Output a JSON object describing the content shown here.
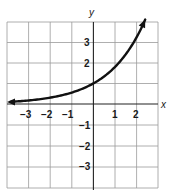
{
  "chart_data": {
    "type": "line",
    "title": "",
    "xlabel": "x",
    "ylabel": "y",
    "xlim": [
      -4,
      3
    ],
    "ylim": [
      -4,
      4
    ],
    "grid": true,
    "x_ticks": [
      "-3",
      "-2",
      "-1",
      "1",
      "2"
    ],
    "y_ticks": [
      "3",
      "2",
      "-1",
      "-2",
      "-3"
    ],
    "series": [
      {
        "name": "exponential curve (approx. y = 1.8^x)",
        "x": [
          -4,
          -3,
          -2,
          -1,
          0,
          1,
          2,
          2.4
        ],
        "y": [
          0.1,
          0.17,
          0.31,
          0.56,
          1,
          1.8,
          3.24,
          4.1
        ],
        "arrows": "both ends"
      }
    ]
  },
  "labels": {
    "x_axis": "x",
    "y_axis": "y",
    "x_ticks": [
      "−3",
      "−2",
      "−1",
      "1",
      "2"
    ],
    "y_ticks": [
      "3",
      "2",
      "−1",
      "−2",
      "−3"
    ]
  }
}
